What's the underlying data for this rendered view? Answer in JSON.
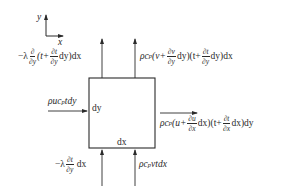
{
  "diagram": {
    "type": "control-volume energy balance",
    "axes": {
      "x_label": "x",
      "y_label": "y"
    },
    "element": {
      "width_label": "dx",
      "height_label": "dy"
    },
    "colors": {
      "line": "#2a2a2a",
      "background": "#ffffff"
    },
    "fluxes": {
      "top_conduction": {
        "direction": "out-top",
        "prefix": "−λ",
        "op_num": "∂",
        "op_den": "∂y",
        "open": "(t+",
        "frac_num": "∂t",
        "frac_den": "∂y",
        "tail": "dy)dx"
      },
      "top_convection": {
        "direction": "out-top",
        "prefix": "ρc",
        "sub": "p",
        "open1": "(v+",
        "frac1_num": "∂v",
        "frac1_den": "∂y",
        "mid": "dy)(t+",
        "frac2_num": "∂t",
        "frac2_den": "∂y",
        "tail": "dy)dx"
      },
      "left_convection": {
        "direction": "in-left",
        "text_a": "ρuc",
        "sub": "p",
        "text_b": "tdy"
      },
      "right_convection": {
        "direction": "out-right",
        "prefix": "ρc",
        "sub": "p",
        "open1": "(u+",
        "frac1_num": "∂u",
        "frac1_den": "∂x",
        "mid": "dx)(t+",
        "frac2_num": "∂t",
        "frac2_den": "∂x",
        "tail": "dx)dy"
      },
      "bottom_conduction": {
        "direction": "in-bottom",
        "prefix": "−λ",
        "frac_num": "∂t",
        "frac_den": "∂y",
        "tail": "dx"
      },
      "bottom_convection": {
        "direction": "in-bottom",
        "text_a": "ρc",
        "sub": "p",
        "text_b": "vtdx"
      }
    }
  }
}
